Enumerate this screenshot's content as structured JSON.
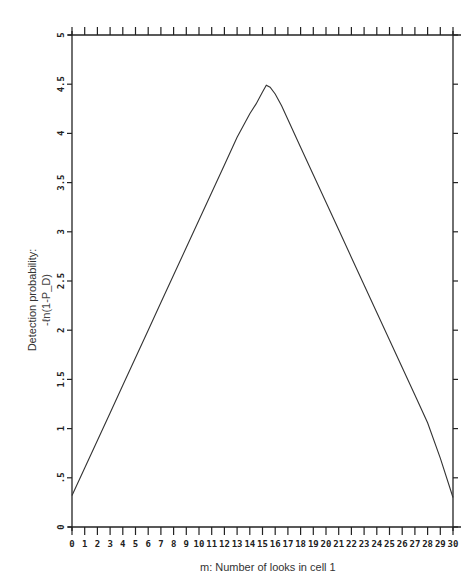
{
  "chart_data": {
    "type": "line",
    "title": "",
    "xlabel": "m:  Number of looks in cell 1",
    "ylabel": "Detection probability:",
    "ylabel_sub": "-ℓn(1-P_D)",
    "xlim": [
      0,
      30
    ],
    "ylim": [
      0,
      5
    ],
    "grid": false,
    "legend": "none",
    "x_ticks": [
      0,
      1,
      2,
      3,
      4,
      5,
      6,
      7,
      8,
      9,
      10,
      11,
      12,
      13,
      14,
      15,
      16,
      17,
      18,
      19,
      20,
      21,
      22,
      23,
      24,
      25,
      26,
      27,
      28,
      29,
      30
    ],
    "y_ticks": [
      {
        "value": 0,
        "label": "0"
      },
      {
        "value": 0.5,
        "label": ".5"
      },
      {
        "value": 1,
        "label": "1"
      },
      {
        "value": 1.5,
        "label": "1.5"
      },
      {
        "value": 2,
        "label": "2"
      },
      {
        "value": 2.5,
        "label": "2.5"
      },
      {
        "value": 3,
        "label": "3"
      },
      {
        "value": 3.5,
        "label": "3.5"
      },
      {
        "value": 4,
        "label": "4"
      },
      {
        "value": 4.5,
        "label": "4.5"
      },
      {
        "value": 5,
        "label": "5"
      }
    ],
    "series": [
      {
        "name": "-ln(1-PD)",
        "x": [
          0,
          1,
          2,
          3,
          4,
          5,
          6,
          7,
          8,
          9,
          10,
          11,
          12,
          13,
          14,
          14.5,
          15,
          15.3,
          15.6,
          16,
          16.5,
          17,
          18,
          19,
          20,
          21,
          22,
          23,
          24,
          25,
          26,
          27,
          28,
          29,
          30
        ],
        "y": [
          0.32,
          0.6,
          0.88,
          1.16,
          1.44,
          1.72,
          2.0,
          2.28,
          2.56,
          2.84,
          3.12,
          3.4,
          3.68,
          3.96,
          4.2,
          4.3,
          4.42,
          4.49,
          4.47,
          4.4,
          4.28,
          4.14,
          3.86,
          3.58,
          3.3,
          3.02,
          2.74,
          2.46,
          2.18,
          1.9,
          1.62,
          1.34,
          1.06,
          0.7,
          0.3
        ]
      }
    ]
  }
}
